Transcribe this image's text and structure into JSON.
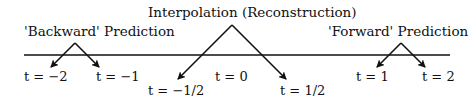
{
  "diagram": {
    "colors": {
      "line": "#111111",
      "text": "#111111",
      "background": "#ffffff"
    },
    "titles": {
      "backward": "'Backward' Prediction",
      "interpolation": "Interpolation (Reconstruction)",
      "forward": "'Forward' Prediction"
    },
    "time_labels": {
      "t_minus_2": "t = −2",
      "t_minus_1": "t = −1",
      "t_minus_half": "t = −1/2",
      "t_zero": "t = 0",
      "t_half": "t = 1/2",
      "t_1": "t = 1",
      "t_2": "t = 2"
    },
    "arrows": [
      {
        "group": "backward",
        "from": "apex",
        "to": "t = −2"
      },
      {
        "group": "backward",
        "from": "apex",
        "to": "t = −1"
      },
      {
        "group": "interpolation",
        "from": "apex",
        "to": "t = −1/2"
      },
      {
        "group": "interpolation",
        "from": "apex",
        "to": "t = 1/2"
      },
      {
        "group": "forward",
        "from": "apex",
        "to": "t = 1"
      },
      {
        "group": "forward",
        "from": "apex",
        "to": "t = 2"
      }
    ]
  }
}
